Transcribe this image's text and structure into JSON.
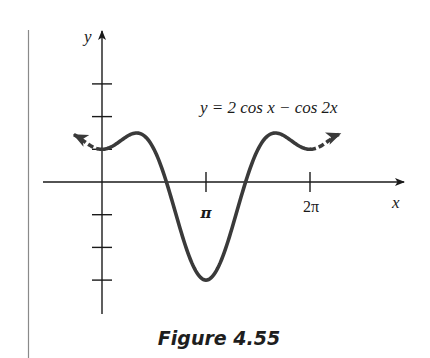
{
  "figure": {
    "caption": "Figure 4.55",
    "equation_label": "y = 2 cos x − cos 2x"
  },
  "chart_data": {
    "type": "line",
    "title": "",
    "function": "y = 2 cos x − cos 2x",
    "xlabel": "x",
    "ylabel": "y",
    "x_ticks": [
      {
        "value": 3.14159,
        "label": "π"
      },
      {
        "value": 6.28319,
        "label": "2π"
      }
    ],
    "y_ticks": [
      -3,
      -2,
      -1,
      1,
      2,
      3
    ],
    "xlim": [
      -1.8,
      9.0
    ],
    "ylim": [
      -4.0,
      4.5
    ],
    "grid": false,
    "legend": null,
    "series": [
      {
        "name": "y = 2 cos x − cos 2x",
        "style": "solid",
        "domain": [
          0,
          6.28319
        ],
        "points": [
          [
            0,
            1
          ],
          [
            0.5236,
            1.232
          ],
          [
            1.0472,
            1.5
          ],
          [
            1.5708,
            1
          ],
          [
            2.0944,
            -0.5
          ],
          [
            2.618,
            -2.232
          ],
          [
            3.1416,
            -3
          ],
          [
            3.6652,
            -2.232
          ],
          [
            4.1888,
            -0.5
          ],
          [
            4.7124,
            1
          ],
          [
            5.236,
            1.5
          ],
          [
            5.7596,
            1.232
          ],
          [
            6.2832,
            1
          ]
        ]
      },
      {
        "name": "left-extension",
        "style": "dashed-arrow",
        "domain": [
          -0.85,
          0
        ]
      },
      {
        "name": "right-extension",
        "style": "dashed-arrow",
        "domain": [
          6.28319,
          7.2
        ]
      }
    ],
    "key_points": {
      "local_max": [
        [
          1.0472,
          1.5
        ],
        [
          5.236,
          1.5
        ]
      ],
      "local_min": [
        [
          0,
          1
        ],
        [
          3.1416,
          -3
        ],
        [
          6.2832,
          1
        ]
      ]
    }
  },
  "colors": {
    "ink": "#1a1a1a",
    "curve": "#3a3a3a",
    "margin_line": "#8a8a8a",
    "background": "#ffffff"
  }
}
